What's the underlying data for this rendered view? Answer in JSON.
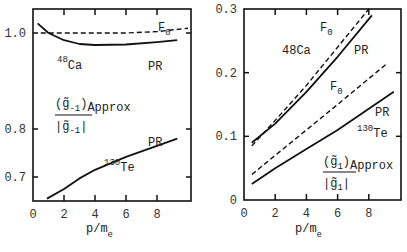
{
  "chart_data": [
    {
      "type": "line",
      "panel": "left",
      "xlabel": "p/m_e",
      "ylabel": "(g̃_-1)Approx / |g̃_-1|",
      "xlim": [
        0,
        10
      ],
      "ylim": [
        0.65,
        1.05
      ],
      "xticks": [
        0,
        2,
        4,
        6,
        8
      ],
      "yticks": [
        0.7,
        0.8,
        1.0
      ],
      "ytick_labels": [
        "0.7",
        "0.8",
        "1.0"
      ],
      "xtick_labels": [
        "0",
        "2",
        "4",
        "6",
        "8"
      ],
      "grid": false,
      "series": [
        {
          "name": "48Ca F0",
          "style": "dashed",
          "x": [
            0.5,
            2,
            4,
            6,
            8,
            10
          ],
          "y": [
            1.0,
            1.0,
            1.0,
            1.0,
            1.003,
            1.01
          ]
        },
        {
          "name": "48Ca PR",
          "style": "solid",
          "x": [
            0.3,
            1,
            2,
            3,
            4,
            6,
            8,
            9.3
          ],
          "y": [
            1.02,
            1.0,
            0.985,
            0.977,
            0.975,
            0.976,
            0.981,
            0.985
          ]
        },
        {
          "name": "130Te PR",
          "style": "solid",
          "x": [
            0.9,
            2,
            3,
            4,
            6,
            8,
            9.3
          ],
          "y": [
            0.655,
            0.675,
            0.697,
            0.715,
            0.742,
            0.765,
            0.78
          ]
        }
      ],
      "annotations": {
        "f0": "F",
        "f0_sub": "0",
        "ca_sup": "48",
        "ca": "Ca",
        "pr1": "PR",
        "pr2": "PR",
        "te_sup": "130",
        "te": "Te",
        "ratio_num": "(g̃",
        "ratio_num_sub": "-1",
        "ratio_num_close": ")",
        "ratio_approx": "Approx",
        "ratio_den": "|g̃",
        "ratio_den_sub": "-1",
        "ratio_den_close": "|"
      }
    },
    {
      "type": "line",
      "panel": "right",
      "xlabel": "p/m_e",
      "ylabel": "(g̃_1)Approx / |g̃_1|",
      "xlim": [
        0,
        10
      ],
      "ylim": [
        0,
        0.3
      ],
      "xticks": [
        0,
        2,
        4,
        6,
        8
      ],
      "yticks": [
        0,
        0.1,
        0.2,
        0.3
      ],
      "ytick_labels": [
        "0",
        "0.1",
        "0.2",
        "0.3"
      ],
      "xtick_labels": [
        "0",
        "2",
        "4",
        "6",
        "8"
      ],
      "grid": false,
      "series": [
        {
          "name": "48Ca F0",
          "style": "dashed",
          "x": [
            0.5,
            2,
            4,
            6,
            8
          ],
          "y": [
            0.085,
            0.125,
            0.18,
            0.24,
            0.3
          ]
        },
        {
          "name": "48Ca PR",
          "style": "solid",
          "x": [
            0.5,
            2,
            4,
            6,
            8.2
          ],
          "y": [
            0.09,
            0.12,
            0.17,
            0.225,
            0.29
          ]
        },
        {
          "name": "130Te F0",
          "style": "dashed",
          "x": [
            0.5,
            2,
            4,
            6,
            9.2
          ],
          "y": [
            0.04,
            0.07,
            0.11,
            0.15,
            0.215
          ]
        },
        {
          "name": "130Te PR",
          "style": "solid",
          "x": [
            0.5,
            2,
            4,
            6,
            9.6
          ],
          "y": [
            0.025,
            0.05,
            0.08,
            0.11,
            0.17
          ]
        }
      ],
      "annotations": {
        "f0a": "F",
        "f0a_sub": "0",
        "f0b": "F",
        "f0b_sub": "0",
        "ca": "48Ca",
        "pr1": "PR",
        "pr2": "PR",
        "te_sup": "130",
        "te": "Te",
        "ratio_num": "(g̃",
        "ratio_num_sub": "1",
        "ratio_num_close": ")",
        "ratio_approx": "Approx",
        "ratio_den": "|g̃",
        "ratio_den_sub": "1",
        "ratio_den_close": "|"
      }
    }
  ],
  "xlabel_main": "p/m",
  "xlabel_sub": "e"
}
